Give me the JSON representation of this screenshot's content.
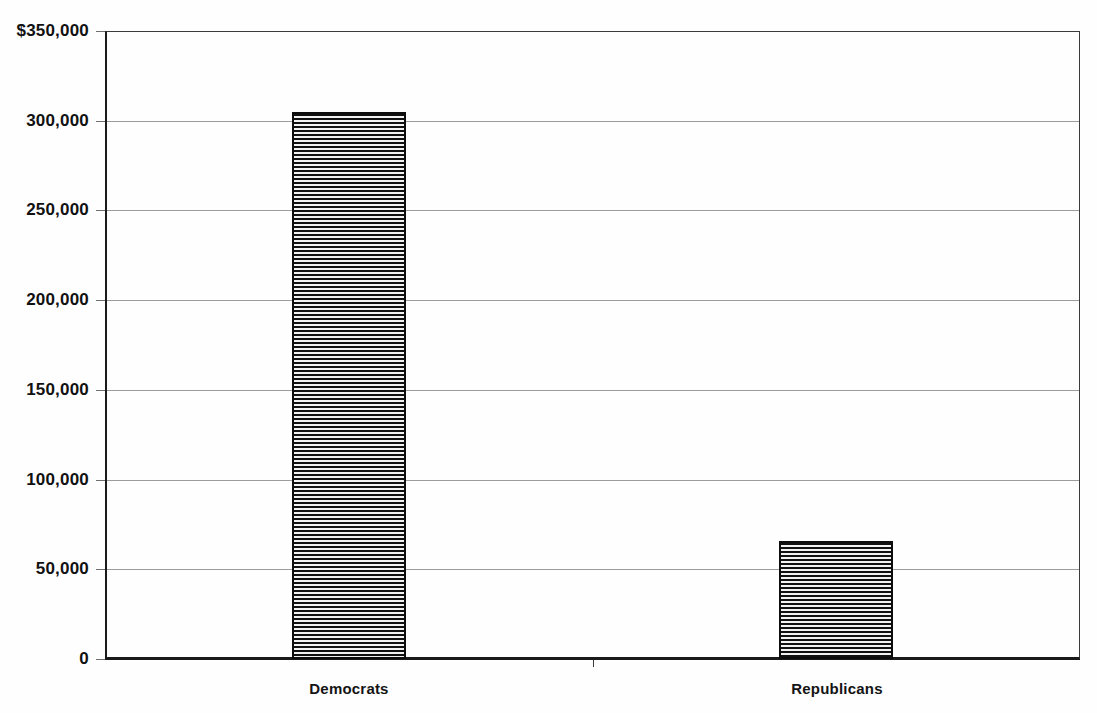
{
  "chart_data": {
    "type": "bar",
    "title": "",
    "subtitle": "",
    "xlabel": "",
    "ylabel": "",
    "categories": [
      "Democrats",
      "Republicans"
    ],
    "values": [
      305000,
      66000
    ],
    "ylim": [
      0,
      350000
    ],
    "ytick_values": [
      0,
      50000,
      100000,
      150000,
      200000,
      250000,
      300000,
      350000
    ],
    "ytick_labels": [
      "0",
      "50,000",
      "100,000",
      "150,000",
      "200,000",
      "250,000",
      "300,000",
      "$350,000"
    ],
    "grid": true,
    "legend": false,
    "legend_position": "none",
    "series": [
      {
        "name": "Contributions",
        "values": [
          305000,
          66000
        ]
      }
    ],
    "bar_fill": "horizontal-stripe-hatch",
    "bar_outline_color": "#0d0d0d",
    "gridline_color": "#9b9b9b",
    "axis_color": "#1a1a1a",
    "background_color": "#fefefe"
  },
  "axis": {
    "y_ticks": [
      {
        "label": "$350,000",
        "value": 350000
      },
      {
        "label": "300,000",
        "value": 300000
      },
      {
        "label": "250,000",
        "value": 250000
      },
      {
        "label": "200,000",
        "value": 200000
      },
      {
        "label": "150,000",
        "value": 150000
      },
      {
        "label": "100,000",
        "value": 100000
      },
      {
        "label": "50,000",
        "value": 50000
      },
      {
        "label": "0",
        "value": 0
      }
    ],
    "x_categories": [
      {
        "label": "Democrats"
      },
      {
        "label": "Republicans"
      }
    ]
  }
}
